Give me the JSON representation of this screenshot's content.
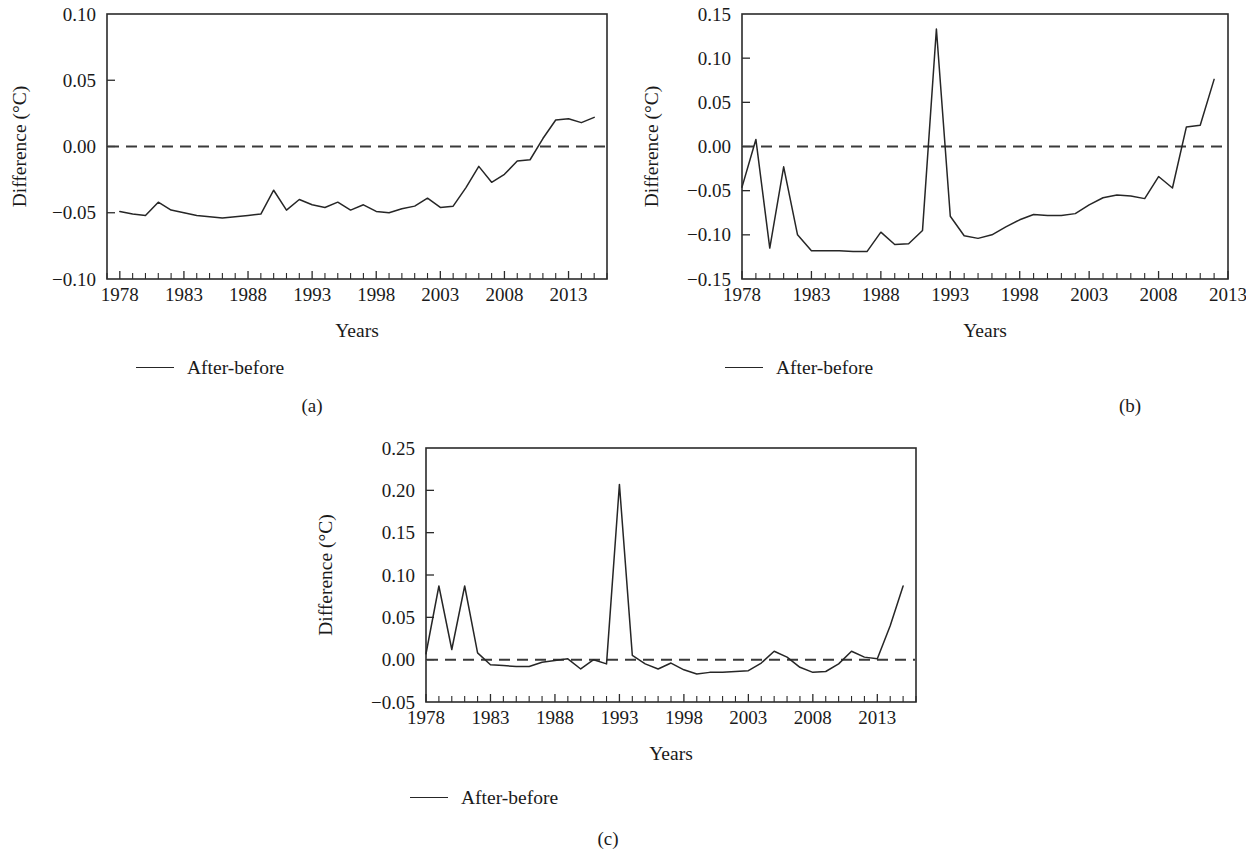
{
  "figure": {
    "background": "#ffffff",
    "line_color": "#262626",
    "axis_color": "#2b2b2b",
    "zero_line_color": "#3a3a3a",
    "panel_captions": [
      "(a)",
      "(b)",
      "(c)"
    ]
  },
  "panels": [
    {
      "caption": "(a)",
      "legend_label": "After-before",
      "chart_data": {
        "type": "line",
        "title": "",
        "xlabel": "Years",
        "ylabel": "Difference (°C)",
        "xlim": [
          1977,
          2016
        ],
        "ylim": [
          -0.1,
          0.1
        ],
        "yticks": [
          -0.1,
          -0.05,
          0.0,
          0.05,
          0.1
        ],
        "ytick_labels": [
          "−0.10",
          "−0.05",
          "0.00",
          "0.05",
          "0.10"
        ],
        "xticks": [
          1978,
          1983,
          1988,
          1993,
          1998,
          2003,
          2008,
          2013
        ],
        "xtick_labels": [
          "1978",
          "1983",
          "1988",
          "1993",
          "1998",
          "2003",
          "2008",
          "2013"
        ],
        "minor_xtick_step": 1,
        "grid": false,
        "legend_position": "below-axes-left",
        "annotations": [
          {
            "type": "hline",
            "y": 0.0,
            "style": "dashed",
            "label": "zero reference"
          }
        ],
        "series": [
          {
            "name": "After-before",
            "x": [
              1978,
              1979,
              1980,
              1981,
              1982,
              1983,
              1984,
              1985,
              1986,
              1987,
              1988,
              1989,
              1990,
              1991,
              1992,
              1993,
              1994,
              1995,
              1996,
              1997,
              1998,
              1999,
              2000,
              2001,
              2002,
              2003,
              2004,
              2005,
              2006,
              2007,
              2008,
              2009,
              2010,
              2011,
              2012,
              2013,
              2014,
              2015
            ],
            "values": [
              -0.049,
              -0.051,
              -0.052,
              -0.042,
              -0.048,
              -0.05,
              -0.052,
              -0.053,
              -0.054,
              -0.053,
              -0.052,
              -0.051,
              -0.033,
              -0.048,
              -0.04,
              -0.044,
              -0.046,
              -0.042,
              -0.048,
              -0.044,
              -0.049,
              -0.05,
              -0.047,
              -0.045,
              -0.039,
              -0.046,
              -0.045,
              -0.031,
              -0.015,
              -0.027,
              -0.021,
              -0.011,
              -0.01,
              0.006,
              0.02,
              0.021,
              0.018,
              0.022
            ]
          }
        ]
      }
    },
    {
      "caption": "(b)",
      "legend_label": "After-before",
      "chart_data": {
        "type": "line",
        "title": "",
        "xlabel": "Years",
        "ylabel": "Difference (°C)",
        "xlim": [
          1978,
          2013
        ],
        "ylim": [
          -0.15,
          0.15
        ],
        "yticks": [
          -0.15,
          -0.1,
          -0.05,
          0.0,
          0.05,
          0.1,
          0.15
        ],
        "ytick_labels": [
          "−0.15",
          "−0.10",
          "−0.05",
          "0.00",
          "0.05",
          "0.10",
          "0.15"
        ],
        "xticks": [
          1978,
          1983,
          1988,
          1993,
          1998,
          2003,
          2008,
          2013
        ],
        "xtick_labels": [
          "1978",
          "1983",
          "1988",
          "1993",
          "1998",
          "2003",
          "2008",
          "2013"
        ],
        "minor_xtick_step": 1,
        "grid": false,
        "legend_position": "below-axes-left",
        "annotations": [
          {
            "type": "hline",
            "y": 0.0,
            "style": "dashed",
            "label": "zero reference"
          }
        ],
        "series": [
          {
            "name": "After-before",
            "x": [
              1978,
              1979,
              1980,
              1981,
              1982,
              1983,
              1984,
              1985,
              1986,
              1987,
              1988,
              1989,
              1990,
              1991,
              1992,
              1993,
              1994,
              1995,
              1996,
              1997,
              1998,
              1999,
              2000,
              2001,
              2002,
              2003,
              2004,
              2005,
              2006,
              2007,
              2008,
              2009,
              2010,
              2011,
              2012
            ],
            "values": [
              -0.046,
              0.008,
              -0.115,
              -0.023,
              -0.1,
              -0.118,
              -0.118,
              -0.118,
              -0.119,
              -0.119,
              -0.097,
              -0.111,
              -0.11,
              -0.095,
              0.133,
              -0.079,
              -0.101,
              -0.104,
              -0.1,
              -0.091,
              -0.083,
              -0.077,
              -0.078,
              -0.078,
              -0.076,
              -0.066,
              -0.058,
              -0.055,
              -0.056,
              -0.059,
              -0.034,
              -0.047,
              0.022,
              0.024,
              0.076,
              0.074
            ]
          }
        ]
      }
    },
    {
      "caption": "(c)",
      "legend_label": "After-before",
      "chart_data": {
        "type": "line",
        "title": "",
        "xlabel": "Years",
        "ylabel": "Difference (°C)",
        "xlim": [
          1978,
          2016
        ],
        "ylim": [
          -0.05,
          0.25
        ],
        "yticks": [
          -0.05,
          0.0,
          0.05,
          0.1,
          0.15,
          0.2,
          0.25
        ],
        "ytick_labels": [
          "−0.05",
          "0.00",
          "0.05",
          "0.10",
          "0.15",
          "0.20",
          "0.25"
        ],
        "xticks": [
          1978,
          1983,
          1988,
          1993,
          1998,
          2003,
          2008,
          2013
        ],
        "xtick_labels": [
          "1978",
          "1983",
          "1988",
          "1993",
          "1998",
          "2003",
          "2008",
          "2013"
        ],
        "minor_xtick_step": 1,
        "grid": false,
        "legend_position": "below-axes-left",
        "annotations": [
          {
            "type": "hline",
            "y": 0.0,
            "style": "dashed",
            "label": "zero reference"
          }
        ],
        "series": [
          {
            "name": "After-before",
            "x": [
              1978,
              1979,
              1980,
              1981,
              1982,
              1983,
              1984,
              1985,
              1986,
              1987,
              1988,
              1989,
              1990,
              1991,
              1992,
              1993,
              1994,
              1995,
              1996,
              1997,
              1998,
              1999,
              2000,
              2001,
              2002,
              2003,
              2004,
              2005,
              2006,
              2007,
              2008,
              2009,
              2010,
              2011,
              2012,
              2013,
              2014,
              2015
            ],
            "values": [
              0.007,
              0.087,
              0.012,
              0.087,
              0.008,
              -0.006,
              -0.007,
              -0.008,
              -0.008,
              -0.003,
              -0.001,
              0.001,
              -0.011,
              0.0,
              -0.005,
              0.207,
              0.005,
              -0.005,
              -0.011,
              -0.004,
              -0.012,
              -0.017,
              -0.015,
              -0.015,
              -0.014,
              -0.013,
              -0.004,
              0.01,
              0.003,
              -0.009,
              -0.015,
              -0.014,
              -0.005,
              0.01,
              0.003,
              0.001,
              0.04,
              0.087
            ]
          }
        ]
      }
    }
  ]
}
